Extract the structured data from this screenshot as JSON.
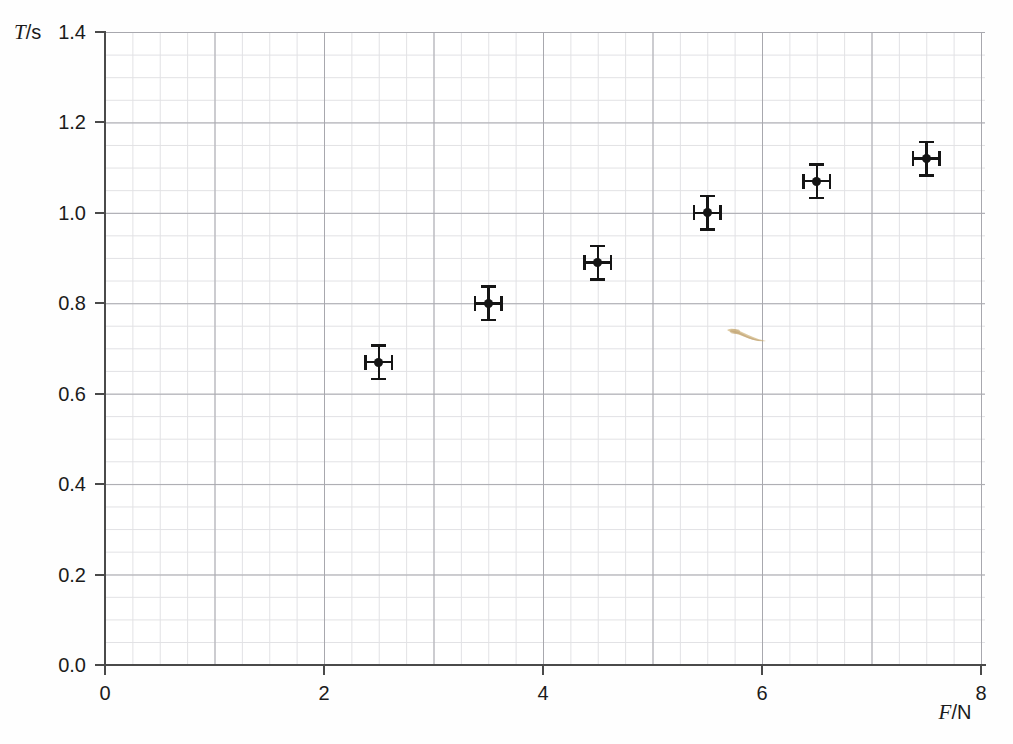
{
  "chart_data": {
    "type": "scatter",
    "title": "",
    "xlabel": "F/N",
    "ylabel": "T/s",
    "xlabel_symbol": "F",
    "xlabel_unit": "/N",
    "ylabel_symbol": "T",
    "ylabel_unit": "/s",
    "xlim": [
      0,
      8
    ],
    "ylim": [
      0.0,
      1.4
    ],
    "xticks": [
      "0",
      "2",
      "4",
      "6",
      "8"
    ],
    "xtick_values": [
      0,
      2,
      4,
      6,
      8
    ],
    "yticks": [
      "0.0",
      "0.2",
      "0.4",
      "0.6",
      "0.8",
      "1.0",
      "1.2",
      "1.4"
    ],
    "ytick_values": [
      0.0,
      0.2,
      0.4,
      0.6,
      0.8,
      1.0,
      1.2,
      1.4
    ],
    "grid": true,
    "grid_minor_x": 0.25,
    "grid_minor_y": 0.05,
    "grid_major_x": 1,
    "grid_major_y": 0.2,
    "legend": "none",
    "marker_color": "#151515",
    "grid_color": "#a8a8ae",
    "grid_minor_color": "#d8d8dc",
    "axis_color": "#4a4a4a",
    "x": [
      2.5,
      3.5,
      4.5,
      5.5,
      6.5,
      7.5
    ],
    "y": [
      0.67,
      0.8,
      0.89,
      1.0,
      1.07,
      1.12
    ],
    "xerr": [
      0.12,
      0.12,
      0.12,
      0.12,
      0.12,
      0.12
    ],
    "yerr": [
      0.037,
      0.037,
      0.037,
      0.037,
      0.037,
      0.037
    ],
    "points": [
      {
        "label": "point-1",
        "x": 2.5,
        "y": 0.67,
        "xerr": 0.12,
        "yerr": 0.037
      },
      {
        "label": "point-2",
        "x": 3.5,
        "y": 0.8,
        "xerr": 0.12,
        "yerr": 0.037
      },
      {
        "label": "point-3",
        "x": 4.5,
        "y": 0.89,
        "xerr": 0.12,
        "yerr": 0.037
      },
      {
        "label": "point-4",
        "x": 5.5,
        "y": 1.0,
        "xerr": 0.12,
        "yerr": 0.037
      },
      {
        "label": "point-5",
        "x": 6.5,
        "y": 1.07,
        "xerr": 0.12,
        "yerr": 0.037
      },
      {
        "label": "point-6",
        "x": 7.5,
        "y": 1.12,
        "xerr": 0.12,
        "yerr": 0.037
      }
    ],
    "artifacts": [
      {
        "name": "scan-smudge",
        "color": "#c9a96a",
        "x": 4.7,
        "y": 0.8
      }
    ]
  }
}
